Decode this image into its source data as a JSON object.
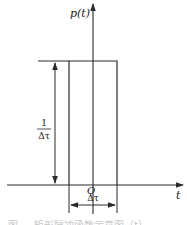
{
  "diagram": {
    "type": "rectangular-pulse",
    "y_axis_label": "p(t)",
    "x_axis_label": "t",
    "origin_label": "O",
    "height_label": {
      "numerator": "1",
      "denominator": "Δτ"
    },
    "width_label": "Δτ",
    "caption": "图 …  矩形脉冲函数示意图（t）",
    "colors": {
      "line": "#2a2a2a",
      "background": "#ffffff"
    }
  }
}
